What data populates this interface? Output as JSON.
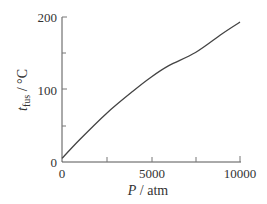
{
  "chart_data": {
    "type": "line",
    "title": "",
    "xlabel": "P / atm",
    "ylabel": "t_fus / °C",
    "xlim": [
      0,
      10000
    ],
    "ylim": [
      0,
      200
    ],
    "grid": false,
    "x_ticks": [
      0,
      2500,
      5000,
      7500,
      10000
    ],
    "x_tick_labels": [
      "0",
      "",
      "5000",
      "",
      "10000"
    ],
    "y_ticks": [
      0,
      50,
      100,
      150,
      200
    ],
    "y_tick_labels": [
      "0",
      "",
      "100",
      "",
      "200"
    ],
    "series": [
      {
        "name": "melting point",
        "x": [
          0,
          1000,
          2500,
          4000,
          5000,
          6000,
          7500,
          9000,
          10000
        ],
        "values": [
          5,
          31,
          67,
          98,
          117,
          133,
          151,
          177,
          193
        ]
      }
    ],
    "line_color": "#444444"
  },
  "labels": {
    "x_axis_var": "P",
    "x_axis_unit": " / atm",
    "y_axis_var": "t",
    "y_axis_sub": "fus",
    "y_axis_unit": " / °C"
  }
}
